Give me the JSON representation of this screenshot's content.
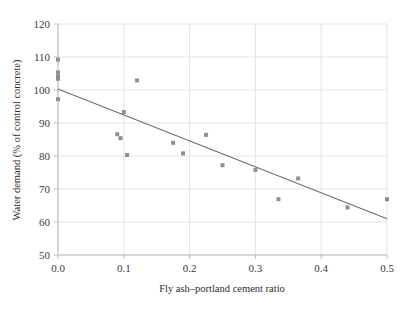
{
  "chart_data": {
    "type": "scatter",
    "title": "",
    "xlabel": "Fly ash–portland cement ratio",
    "ylabel": "Water demand (% of control concrete)",
    "xlim": [
      0.0,
      0.5
    ],
    "ylim": [
      50,
      120
    ],
    "xticks": [
      0.0,
      0.1,
      0.2,
      0.3,
      0.4,
      0.5
    ],
    "xtick_labels": [
      "0.0",
      "0.1",
      "0.2",
      "0.3",
      "0.4",
      "0.5"
    ],
    "yticks": [
      50,
      60,
      70,
      80,
      90,
      100,
      110,
      120
    ],
    "ytick_labels": [
      "50",
      "60",
      "70",
      "80",
      "90",
      "100",
      "110",
      "120"
    ],
    "grid": true,
    "grid_color": "#dddddd",
    "legend": null,
    "marker": "square",
    "marker_color": "#8f8f8f",
    "marker_size": 4,
    "line_color": "#6e6e6e",
    "axis_color": "#bdbdbd",
    "points": [
      {
        "x": 0.0,
        "y": 109.2
      },
      {
        "x": 0.0,
        "y": 105.3
      },
      {
        "x": 0.0,
        "y": 104.1
      },
      {
        "x": 0.0,
        "y": 103.4
      },
      {
        "x": 0.0,
        "y": 97.2
      },
      {
        "x": 0.09,
        "y": 86.6
      },
      {
        "x": 0.095,
        "y": 85.4
      },
      {
        "x": 0.1,
        "y": 93.3
      },
      {
        "x": 0.105,
        "y": 80.3
      },
      {
        "x": 0.12,
        "y": 102.9
      },
      {
        "x": 0.175,
        "y": 84.0
      },
      {
        "x": 0.19,
        "y": 80.8
      },
      {
        "x": 0.225,
        "y": 86.4
      },
      {
        "x": 0.25,
        "y": 77.2
      },
      {
        "x": 0.3,
        "y": 75.8
      },
      {
        "x": 0.335,
        "y": 66.9
      },
      {
        "x": 0.365,
        "y": 73.2
      },
      {
        "x": 0.44,
        "y": 64.4
      },
      {
        "x": 0.5,
        "y": 66.9
      }
    ],
    "fit_line": {
      "x": [
        0.0,
        0.5
      ],
      "y": [
        100.3,
        61.0
      ],
      "intercept": 100.3,
      "slope": -78.6
    }
  }
}
